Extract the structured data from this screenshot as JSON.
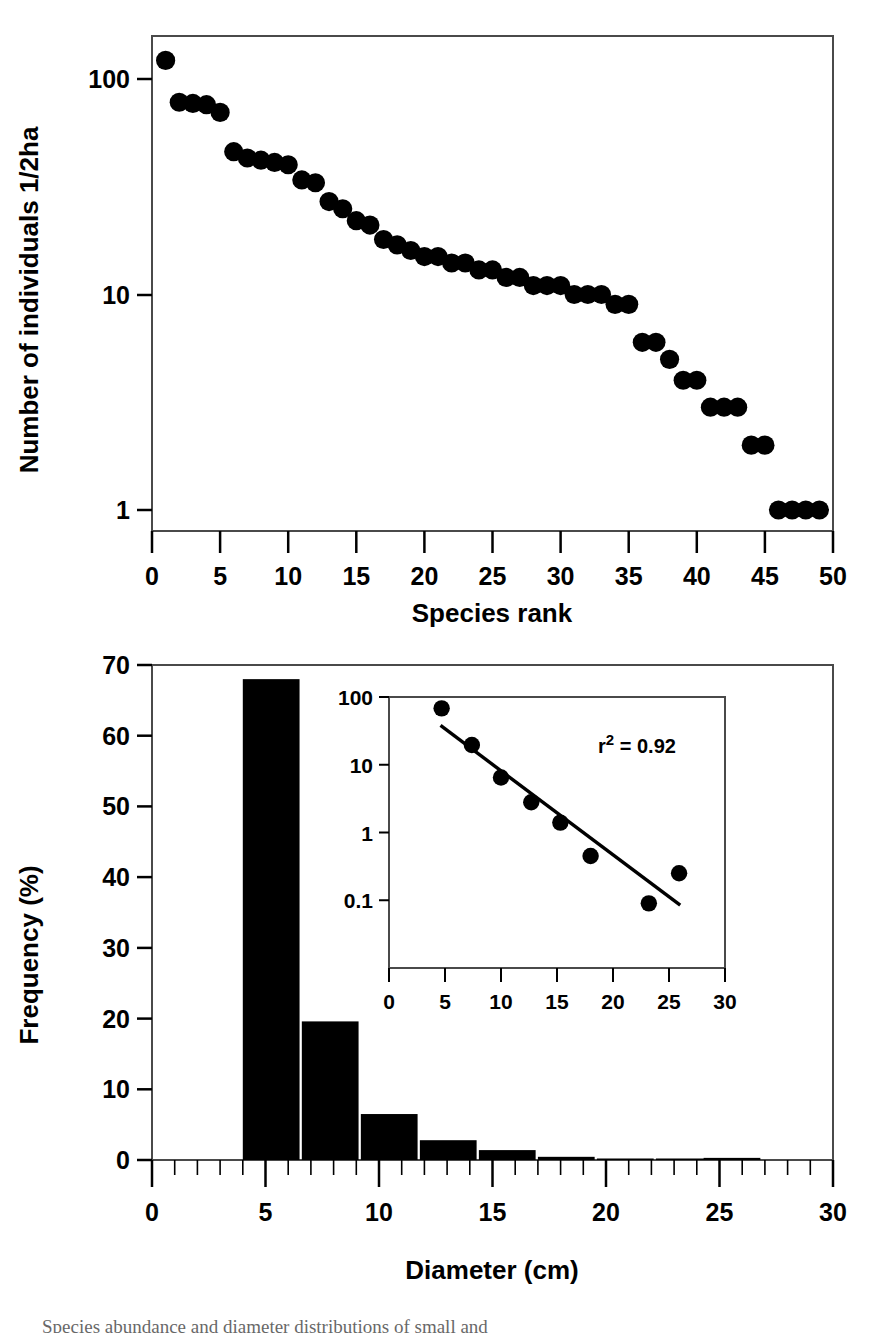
{
  "figure": {
    "panels": [
      "species-rank-abundance",
      "diameter-frequency"
    ],
    "caption_partial": "Species abundance and diameter distributions of small and"
  },
  "chart_data": [
    {
      "type": "scatter",
      "id": "panel-a-rank-abundance",
      "title": "",
      "xlabel": "Species rank",
      "ylabel": "Number of individuals 1/2ha",
      "xlim": [
        0,
        50
      ],
      "ylim": [
        1,
        140
      ],
      "yscale": "log",
      "xticks": [
        0,
        5,
        10,
        15,
        20,
        25,
        30,
        35,
        40,
        45,
        50
      ],
      "yticks": [
        1,
        10,
        100
      ],
      "ytick_labels": [
        "1",
        "10",
        "100"
      ],
      "grid": false,
      "legend": null,
      "marker": "filled-circle",
      "marker_color": "#000000",
      "x": [
        1,
        2,
        3,
        4,
        5,
        6,
        7,
        8,
        9,
        10,
        11,
        12,
        13,
        14,
        15,
        16,
        17,
        18,
        19,
        20,
        21,
        22,
        23,
        24,
        25,
        26,
        27,
        28,
        29,
        30,
        31,
        32,
        33,
        34,
        35,
        36,
        37,
        38,
        39,
        40,
        41,
        42,
        43,
        44,
        45,
        46,
        47,
        48,
        49
      ],
      "y": [
        122,
        78,
        77,
        76,
        70,
        46,
        43,
        42,
        41,
        40,
        34,
        33,
        27,
        25,
        22,
        21,
        18,
        17,
        16,
        15,
        15,
        14,
        14,
        13,
        13,
        12,
        12,
        11,
        11,
        11,
        10,
        10,
        10,
        9,
        9,
        6,
        6,
        5,
        4,
        4,
        3,
        3,
        3,
        2,
        2,
        1,
        1,
        1,
        1
      ],
      "y_note": "values read off log axis; tail of ones spans ranks 38-49"
    },
    {
      "type": "bar",
      "id": "panel-b-diameter-frequency",
      "title": "",
      "xlabel": "Diameter (cm)",
      "ylabel": "Frequency (%)",
      "xlim": [
        0,
        30
      ],
      "ylim": [
        0,
        70
      ],
      "xticks": [
        0,
        5,
        10,
        15,
        20,
        25,
        30
      ],
      "yticks": [
        0,
        10,
        20,
        30,
        40,
        50,
        60,
        70
      ],
      "grid": false,
      "bar_color": "#000000",
      "bin_width": 2.5,
      "bin_starts": [
        4.0,
        6.6,
        9.2,
        11.8,
        14.4,
        17.0,
        19.6,
        22.2,
        24.3
      ],
      "categories": [
        "4.0-6.5",
        "6.6-9.1",
        "9.2-11.7",
        "11.8-14.3",
        "14.4-16.9",
        "17.0-19.5",
        "19.6-22.1",
        "22.2-24.2",
        "24.3-26.8"
      ],
      "values": [
        68.0,
        19.6,
        6.5,
        2.8,
        1.4,
        0.45,
        0.1,
        0.15,
        0.3
      ]
    },
    {
      "type": "scatter",
      "id": "panel-b-inset-log-frequency",
      "inset": true,
      "title": "",
      "xlabel": "",
      "ylabel": "",
      "xlim": [
        0,
        30
      ],
      "ylim": [
        0.07,
        100
      ],
      "yscale": "log",
      "xticks": [
        0,
        5,
        10,
        15,
        20,
        25,
        30
      ],
      "yticks": [
        0.1,
        1,
        10,
        100
      ],
      "ytick_labels": [
        "0.1",
        "1",
        "10",
        "100"
      ],
      "grid": false,
      "marker": "filled-circle",
      "marker_color": "#000000",
      "annotation": "r2 = 0.92",
      "annotation_r": "r",
      "annotation_sup": "2",
      "annotation_rest": " = 0.92",
      "x": [
        4.7,
        7.4,
        10.0,
        12.7,
        15.3,
        18.0,
        23.2,
        25.9
      ],
      "y": [
        68.0,
        19.6,
        6.5,
        2.8,
        1.4,
        0.45,
        0.09,
        0.25
      ],
      "trendline": {
        "x": [
          4.6,
          26.0
        ],
        "y": [
          38.0,
          0.085
        ],
        "color": "#000000"
      }
    }
  ],
  "panel_a": {
    "ylabel": "Number of individuals 1/2ha",
    "xlabel": "Species rank",
    "ytick_labels": [
      "100",
      "10",
      "1"
    ],
    "xtick_labels": [
      "0",
      "5",
      "10",
      "15",
      "20",
      "25",
      "30",
      "35",
      "40",
      "45",
      "50"
    ]
  },
  "panel_b": {
    "ylabel": "Frequency (%)",
    "xlabel": "Diameter (cm)",
    "ytick_labels": [
      "70",
      "60",
      "50",
      "40",
      "30",
      "20",
      "10",
      "0"
    ],
    "xtick_labels": [
      "0",
      "5",
      "10",
      "15",
      "20",
      "25",
      "30"
    ]
  },
  "inset": {
    "ytick_labels": [
      "100",
      "10",
      "1",
      "0.1"
    ],
    "xtick_labels": [
      "0",
      "5",
      "10",
      "15",
      "20",
      "25",
      "30"
    ],
    "r_symbol": "r",
    "r_exponent": "2",
    "r_value": " = 0.92"
  }
}
